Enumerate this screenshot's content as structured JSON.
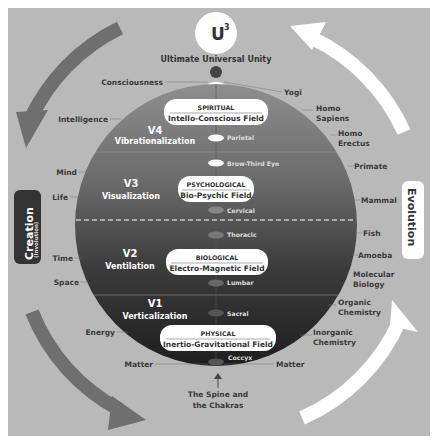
{
  "top": {
    "symbol": "U",
    "superscript": "3",
    "title": "Ultimate Universal Unity"
  },
  "side_labels": {
    "left": {
      "main": "Creation",
      "sub": "(Involution)"
    },
    "right": {
      "main": "Evolution"
    }
  },
  "levels": [
    {
      "id": "V4",
      "name": "Vibrationalization",
      "field_type": "SPIRITUAL",
      "field_name": "Intello-Conscious Field"
    },
    {
      "id": "V3",
      "name": "Visualization",
      "field_type": "PSYCHOLOGICAL",
      "field_name": "Bio-Psychic Field"
    },
    {
      "id": "V2",
      "name": "Ventilation",
      "field_type": "BIOLOGICAL",
      "field_name": "Electro-Magnetic Field"
    },
    {
      "id": "V1",
      "name": "Verticalization",
      "field_type": "PHYSICAL",
      "field_name": "Inertio-Gravitational Field"
    }
  ],
  "chakras": [
    "Parietal",
    "Brow-Third Eye",
    "Cervical",
    "Thoracic",
    "Lumbar",
    "Sacral",
    "Coccyx"
  ],
  "left_labels": [
    "Consciousness",
    "Intelligence",
    "Mind",
    "Life",
    "Time",
    "Space",
    "Energy",
    "Matter"
  ],
  "right_labels": [
    "Yogi",
    "Homo Sapiens",
    "Homo Erectus",
    "Primate",
    "Mammal",
    "Fish",
    "Amoeba",
    "Molecular Biology",
    "Organic Chemistry",
    "Inorganic Chemistry",
    "Matter"
  ],
  "bottom_caption": {
    "line1": "The Spine and",
    "line2": "the Chakras"
  },
  "colors": {
    "background": "#b9b9b9",
    "sphere_top": "#8a8a8a",
    "sphere_bottom": "#222222",
    "creation_arrow": "#6f6f6f",
    "evolution_arrow": "#ffffff",
    "label_text": "#3a3a3a"
  }
}
